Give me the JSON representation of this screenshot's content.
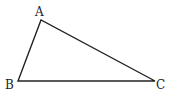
{
  "diagram": {
    "type": "triangle",
    "stroke_color": "#222222",
    "vertices": [
      {
        "label": "A",
        "x": 41,
        "y": 20
      },
      {
        "label": "B",
        "x": 18,
        "y": 81
      },
      {
        "label": "C",
        "x": 155,
        "y": 81
      }
    ],
    "labels": {
      "A": "A",
      "B": "B",
      "C": "C"
    }
  }
}
